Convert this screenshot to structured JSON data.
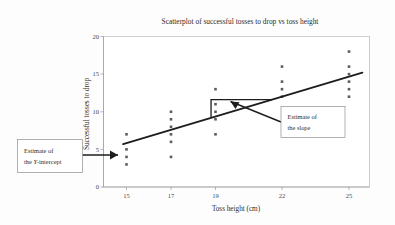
{
  "chart_data": {
    "type": "scatter",
    "title": "Scatterplot of successful tosses to drop vs toss height",
    "xlabel": "Toss height (cm)",
    "ylabel": "Successful tosses to drop",
    "xlim": [
      14,
      26
    ],
    "ylim": [
      0,
      20
    ],
    "grid": false,
    "legend": "none",
    "xticks": [
      "15",
      "17",
      "19",
      "22",
      "25"
    ],
    "xtick_values": [
      15,
      17,
      19,
      22,
      25
    ],
    "yticks": [
      "0",
      "5",
      "10",
      "15",
      "20"
    ],
    "ytick_values": [
      0,
      5,
      10,
      15,
      20
    ],
    "points": [
      {
        "x": 15,
        "y": 7
      },
      {
        "x": 15,
        "y": 5
      },
      {
        "x": 15,
        "y": 4
      },
      {
        "x": 15,
        "y": 3
      },
      {
        "x": 17,
        "y": 10
      },
      {
        "x": 17,
        "y": 9
      },
      {
        "x": 17,
        "y": 8
      },
      {
        "x": 17,
        "y": 7
      },
      {
        "x": 17,
        "y": 6
      },
      {
        "x": 17,
        "y": 4
      },
      {
        "x": 19,
        "y": 13
      },
      {
        "x": 19,
        "y": 11
      },
      {
        "x": 19,
        "y": 10
      },
      {
        "x": 19,
        "y": 9
      },
      {
        "x": 19,
        "y": 7
      },
      {
        "x": 22,
        "y": 16
      },
      {
        "x": 22,
        "y": 14
      },
      {
        "x": 22,
        "y": 13
      },
      {
        "x": 22,
        "y": 12
      },
      {
        "x": 25,
        "y": 18
      },
      {
        "x": 25,
        "y": 16
      },
      {
        "x": 25,
        "y": 15
      },
      {
        "x": 25,
        "y": 14
      },
      {
        "x": 25,
        "y": 13
      },
      {
        "x": 25,
        "y": 12
      }
    ],
    "trendline": {
      "name": "least-squares fit line",
      "x_start": 14.85,
      "y_start": 5.7,
      "x_end": 25.6,
      "y_end": 15.2
    },
    "slope_triangle": {
      "name": "rise over run indicator",
      "x_left": 18.8,
      "x_right": 21.5,
      "y_top": 11.6,
      "y_bottom": 9.3
    }
  },
  "annotations": {
    "intercept": {
      "line1": "Estimate of",
      "line2_prefix": "the ",
      "line2_italic": "Y",
      "line2_suffix": "-intercept"
    },
    "slope": {
      "line1": "Estimate of",
      "line2": "the slope"
    }
  },
  "colors": {
    "point": "#5c5c5c",
    "line": "#1d1d1d",
    "frame": "#b9b9b9",
    "background": "#fdfdfd"
  }
}
